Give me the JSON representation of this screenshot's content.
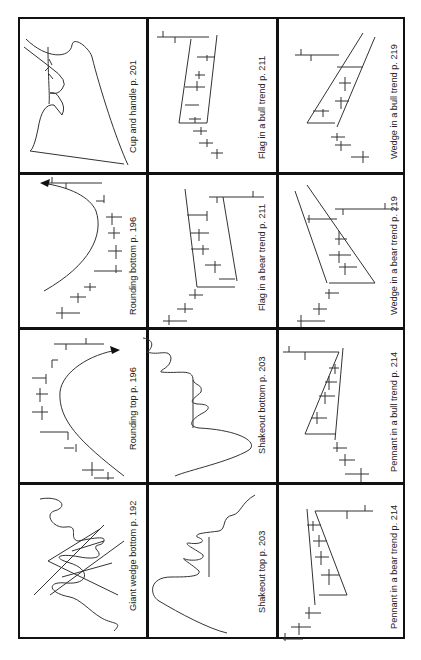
{
  "figure": {
    "layout": {
      "columns": 3,
      "rows": 4
    },
    "cells": [
      {
        "id": "c00",
        "label": "Cup and handle p. 201"
      },
      {
        "id": "c01",
        "label": "Flag in a bull trend p. 211"
      },
      {
        "id": "c02",
        "label": "Wedge in a bull trend p. 219"
      },
      {
        "id": "c10",
        "label": "Rounding bottom p. 196"
      },
      {
        "id": "c11",
        "label": "Flag in a bear trend p. 211"
      },
      {
        "id": "c12",
        "label": "Wedge in a bear trend p. 219"
      },
      {
        "id": "c20",
        "label": "Rounding top p. 196"
      },
      {
        "id": "c21",
        "label": "Shakeout bottom p. 203"
      },
      {
        "id": "c22",
        "label": "Pennant in a bull trend p. 214"
      },
      {
        "id": "c30",
        "label": "Giant wedge bottom p. 192"
      },
      {
        "id": "c31",
        "label": "Shakeout top p. 203"
      },
      {
        "id": "c32",
        "label": "Pennant in a bear trend p. 214"
      }
    ]
  }
}
